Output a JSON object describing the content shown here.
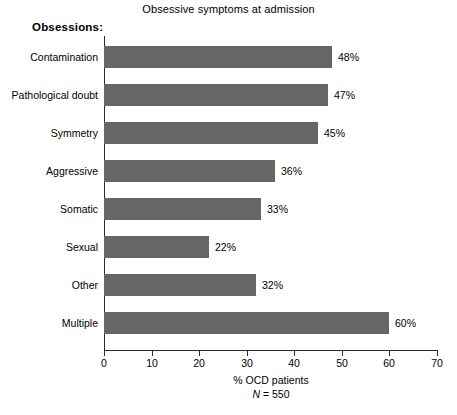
{
  "chart_data": {
    "type": "bar",
    "orientation": "horizontal",
    "title": "Obsessive symptoms at admission",
    "group_heading": "Obsessions:",
    "categories": [
      "Contamination",
      "Pathological doubt",
      "Symmetry",
      "Aggressive",
      "Somatic",
      "Sexual",
      "Other",
      "Multiple"
    ],
    "values": [
      48,
      47,
      45,
      36,
      33,
      22,
      32,
      60
    ],
    "value_labels": [
      "48%",
      "47%",
      "45%",
      "36%",
      "33%",
      "22%",
      "32%",
      "60%"
    ],
    "xlabel": "% OCD patients",
    "ylabel": "",
    "xlim": [
      0,
      70
    ],
    "xticks": [
      0,
      10,
      20,
      30,
      40,
      50,
      60,
      70
    ],
    "xtick_labels": [
      "0",
      "10",
      "20",
      "30",
      "40",
      "50",
      "60",
      "70"
    ],
    "grid": false,
    "legend": false,
    "sample_size_prefix": "N",
    "sample_size_equals": " = ",
    "sample_size_value": "550",
    "sample_size_note": "N = 550",
    "bar_color": "#666666",
    "axis_color": "#2b2b2b",
    "background_color": "#ffffff",
    "text_color": "#000000"
  }
}
